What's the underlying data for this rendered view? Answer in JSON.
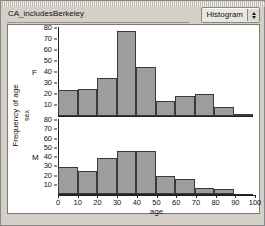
{
  "window": {
    "title": "CA_includesBerkeley",
    "popup": {
      "label": "Histogram",
      "stepper_up_icon": "chevron-up-icon",
      "stepper_down_icon": "chevron-down-icon"
    }
  },
  "chart_data": {
    "type": "bar",
    "title": "CA_includesBerkeley",
    "xlabel": "age",
    "ylabel": "Frequency of age",
    "group_label": "sex",
    "grid": false,
    "legend": "none",
    "xlim": [
      0,
      100
    ],
    "ylim": [
      0,
      80
    ],
    "xticks": [
      0,
      10,
      20,
      30,
      40,
      50,
      60,
      70,
      80,
      90,
      100
    ],
    "yticks": [
      10,
      20,
      30,
      40,
      50,
      60,
      70,
      80
    ],
    "bin_width": 10,
    "bin_starts": [
      0,
      10,
      20,
      30,
      40,
      50,
      60,
      70,
      80,
      90
    ],
    "panels": [
      {
        "facet": "F",
        "categories": [
          "0-10",
          "10-20",
          "20-30",
          "30-40",
          "40-50",
          "50-60",
          "60-70",
          "70-80",
          "80-90",
          "90-100"
        ],
        "values": [
          24,
          25,
          35,
          77,
          45,
          14,
          18,
          20,
          8,
          2
        ]
      },
      {
        "facet": "M",
        "categories": [
          "0-10",
          "10-20",
          "20-30",
          "30-40",
          "40-50",
          "50-60",
          "60-70",
          "70-80",
          "80-90",
          "90-100"
        ],
        "values": [
          29,
          25,
          39,
          46,
          47,
          20,
          16,
          7,
          5,
          0
        ]
      }
    ]
  }
}
